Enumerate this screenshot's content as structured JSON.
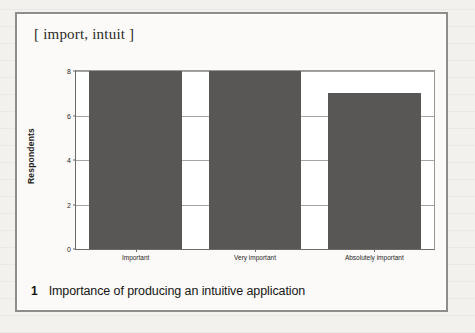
{
  "figure": {
    "header": "[ import, intuit ]",
    "caption_number": "1",
    "caption_text": "Importance of producing an intuitive application"
  },
  "colors": {
    "bar_fill": "#585756",
    "gridline": "#a6a4a0",
    "axis_line": "#6d6b68",
    "figure_border": "#8e8d8a",
    "plot_background": "#ffffff",
    "figure_background": "#fbfaf8",
    "page_background": "#f2f1ee"
  },
  "chart_data": {
    "type": "bar",
    "title": "",
    "subtitle": "",
    "categories": [
      "Important",
      "Very important",
      "Absolutely important"
    ],
    "values": [
      8,
      8,
      7
    ],
    "xlabel": "",
    "ylabel": "Respondents",
    "ylim": [
      0,
      8
    ],
    "yticks": [
      0,
      2,
      4,
      6,
      8
    ],
    "ytick_labels": [
      "0",
      "2",
      "4",
      "6",
      "8"
    ],
    "grid": true,
    "grid_axis": "y",
    "legend": false,
    "legend_position": "none",
    "series": [
      {
        "name": "Respondents",
        "values": [
          8,
          8,
          7
        ]
      }
    ]
  }
}
